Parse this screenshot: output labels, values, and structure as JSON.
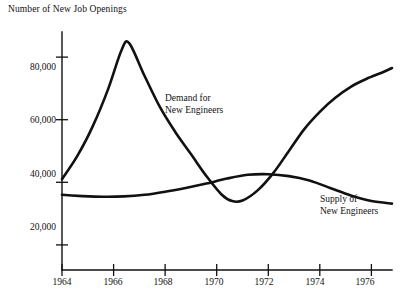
{
  "chart_data": {
    "type": "line",
    "title": "Number of New Job Openings",
    "xlabel": "",
    "ylabel": "",
    "grid": false,
    "legend_position": "inline-annotation",
    "xlim": [
      1964,
      1976.8
    ],
    "ylim": [
      12000,
      88000
    ],
    "x_ticks": [
      1964,
      1966,
      1968,
      1970,
      1972,
      1974,
      1976
    ],
    "x_tick_labels": [
      "1964",
      "1966",
      "1968",
      "1970",
      "1972",
      "1974",
      "1976"
    ],
    "y_ticks": [
      20000,
      40000,
      60000,
      80000
    ],
    "y_tick_labels": [
      "20,000",
      "40,000",
      "60,000",
      "80,000"
    ],
    "series": [
      {
        "name": "Demand for New Engineers",
        "annotation": "Demand for\nNew Engineers",
        "annotation_line1": "Demand for",
        "annotation_line2": "New Engineers",
        "x": [
          1964.0,
          1964.6,
          1965.2,
          1965.8,
          1966.3,
          1966.6,
          1967.2,
          1967.8,
          1968.4,
          1969.0,
          1969.6,
          1970.2,
          1970.6,
          1971.0,
          1971.6,
          1972.2,
          1972.8,
          1973.4,
          1974.0,
          1974.6,
          1975.2,
          1975.8,
          1976.4,
          1976.8
        ],
        "y": [
          41000,
          48500,
          58000,
          70000,
          82000,
          84500,
          74000,
          64000,
          56000,
          49000,
          42000,
          36000,
          34000,
          34200,
          37500,
          43000,
          50000,
          57000,
          62500,
          67000,
          70500,
          73000,
          75000,
          76500
        ]
      },
      {
        "name": "Supply of New Engineers",
        "annotation": "Supply of\nNew Engineers",
        "annotation_line1": "Supply of",
        "annotation_line2": "New Engineers",
        "x": [
          1964.0,
          1964.8,
          1965.6,
          1966.4,
          1967.2,
          1968.0,
          1968.8,
          1969.6,
          1970.4,
          1971.2,
          1972.0,
          1972.8,
          1973.6,
          1974.4,
          1975.2,
          1976.0,
          1976.8
        ],
        "y": [
          36000,
          35600,
          35400,
          35500,
          36000,
          37000,
          38200,
          39600,
          41200,
          42400,
          42600,
          42000,
          40600,
          38200,
          35800,
          34000,
          33200
        ]
      }
    ]
  },
  "axes": {
    "y_axis_name": "vertical-value-axis",
    "x_axis_name": "horizontal-year-axis"
  }
}
